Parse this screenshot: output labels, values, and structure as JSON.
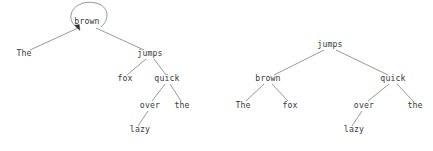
{
  "figure": {
    "title": "",
    "background_color": "#ffffff",
    "text_color": "#3a3a3a",
    "edge_color": "#6b6b6b",
    "arrow_color": "#2e2e2e"
  },
  "trees": [
    {
      "id": "left-tree",
      "name": "tree-with-self-loop",
      "root": "brown",
      "has_self_loop": true,
      "loop_target": "brown",
      "nodes": [
        {
          "id": "l-brown",
          "label": "brown",
          "x": 87,
          "y": 24,
          "depth": 0
        },
        {
          "id": "l-the",
          "label": "The",
          "x": 24,
          "y": 56,
          "depth": 1
        },
        {
          "id": "l-jumps",
          "label": "jumps",
          "x": 150,
          "y": 56,
          "depth": 1
        },
        {
          "id": "l-fox",
          "label": "fox",
          "x": 125,
          "y": 81,
          "depth": 2
        },
        {
          "id": "l-quick",
          "label": "quick",
          "x": 167,
          "y": 81,
          "depth": 2
        },
        {
          "id": "l-over",
          "label": "over",
          "x": 150,
          "y": 108,
          "depth": 3
        },
        {
          "id": "l-the2",
          "label": "the",
          "x": 182,
          "y": 108,
          "depth": 3
        },
        {
          "id": "l-lazy",
          "label": "lazy",
          "x": 140,
          "y": 132,
          "depth": 4
        }
      ],
      "edges": [
        {
          "from": "l-brown",
          "to": "l-the"
        },
        {
          "from": "l-brown",
          "to": "l-jumps"
        },
        {
          "from": "l-jumps",
          "to": "l-fox"
        },
        {
          "from": "l-jumps",
          "to": "l-quick"
        },
        {
          "from": "l-quick",
          "to": "l-over"
        },
        {
          "from": "l-quick",
          "to": "l-the2"
        },
        {
          "from": "l-over",
          "to": "l-lazy"
        }
      ]
    },
    {
      "id": "right-tree",
      "name": "tree-plain",
      "root": "jumps",
      "has_self_loop": false,
      "nodes": [
        {
          "id": "r-jumps",
          "label": "jumps",
          "x": 330,
          "y": 47,
          "depth": 0
        },
        {
          "id": "r-brown",
          "label": "brown",
          "x": 268,
          "y": 81,
          "depth": 1
        },
        {
          "id": "r-quick",
          "label": "quick",
          "x": 393,
          "y": 81,
          "depth": 1
        },
        {
          "id": "r-the",
          "label": "The",
          "x": 243,
          "y": 108,
          "depth": 2
        },
        {
          "id": "r-fox",
          "label": "fox",
          "x": 290,
          "y": 108,
          "depth": 2
        },
        {
          "id": "r-over",
          "label": "over",
          "x": 364,
          "y": 108,
          "depth": 2
        },
        {
          "id": "r-the2",
          "label": "the",
          "x": 415,
          "y": 108,
          "depth": 2
        },
        {
          "id": "r-lazy",
          "label": "lazy",
          "x": 354,
          "y": 132,
          "depth": 3
        }
      ],
      "edges": [
        {
          "from": "r-jumps",
          "to": "r-brown"
        },
        {
          "from": "r-jumps",
          "to": "r-quick"
        },
        {
          "from": "r-brown",
          "to": "r-the"
        },
        {
          "from": "r-brown",
          "to": "r-fox"
        },
        {
          "from": "r-quick",
          "to": "r-over"
        },
        {
          "from": "r-quick",
          "to": "r-the2"
        },
        {
          "from": "r-over",
          "to": "r-lazy"
        }
      ]
    }
  ],
  "words": [
    "The",
    "brown",
    "fox",
    "jumps",
    "quick",
    "over",
    "the",
    "lazy"
  ]
}
